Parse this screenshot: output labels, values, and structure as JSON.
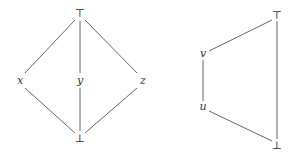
{
  "diagrams": [
    {
      "name": "M3",
      "nodes": [
        {
          "id": "top",
          "label": "⊤",
          "x": 80,
          "y": 13
        },
        {
          "id": "x",
          "label": "x",
          "x": 20,
          "y": 81
        },
        {
          "id": "y",
          "label": "y",
          "x": 80,
          "y": 81
        },
        {
          "id": "z",
          "label": "z",
          "x": 143,
          "y": 81
        },
        {
          "id": "bot",
          "label": "⊥",
          "x": 80,
          "y": 138
        }
      ],
      "edges": [
        [
          "top",
          "x"
        ],
        [
          "top",
          "y"
        ],
        [
          "top",
          "z"
        ],
        [
          "x",
          "bot"
        ],
        [
          "y",
          "bot"
        ],
        [
          "z",
          "bot"
        ]
      ]
    },
    {
      "name": "N5",
      "nodes": [
        {
          "id": "top",
          "label": "⊤",
          "x": 277,
          "y": 15
        },
        {
          "id": "v",
          "label": "v",
          "x": 203,
          "y": 54
        },
        {
          "id": "u",
          "label": "u",
          "x": 203,
          "y": 107
        },
        {
          "id": "bot",
          "label": "⊥",
          "x": 277,
          "y": 145
        }
      ],
      "edges": [
        [
          "top",
          "v"
        ],
        [
          "v",
          "u"
        ],
        [
          "u",
          "bot"
        ],
        [
          "top",
          "bot"
        ]
      ]
    }
  ],
  "labels": {
    "m3_top": "⊤",
    "m3_x": "x",
    "m3_y": "y",
    "m3_z": "z",
    "m3_bot": "⊥",
    "n5_top": "⊤",
    "n5_v": "v",
    "n5_u": "u",
    "n5_bot": "⊥"
  }
}
